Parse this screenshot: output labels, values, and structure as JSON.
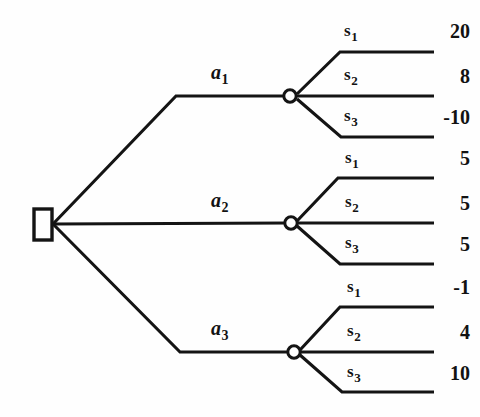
{
  "diagram": {
    "type": "decision-tree",
    "background_color": "#fefefe",
    "line_color": "#141414",
    "root": {
      "node_type": "decision",
      "shape": "square",
      "label": ""
    },
    "branches": [
      {
        "action_label": "a",
        "action_subscript": "1",
        "node_type": "chance",
        "shape": "circle",
        "outcomes": [
          {
            "state_label": "s",
            "state_subscript": "1",
            "payoff": "20"
          },
          {
            "state_label": "s",
            "state_subscript": "2",
            "payoff": "8"
          },
          {
            "state_label": "s",
            "state_subscript": "3",
            "payoff": "-10"
          }
        ]
      },
      {
        "action_label": "a",
        "action_subscript": "2",
        "node_type": "chance",
        "shape": "circle",
        "outcomes": [
          {
            "state_label": "s",
            "state_subscript": "1",
            "payoff": "5"
          },
          {
            "state_label": "s",
            "state_subscript": "2",
            "payoff": "5"
          },
          {
            "state_label": "s",
            "state_subscript": "3",
            "payoff": "5"
          }
        ]
      },
      {
        "action_label": "a",
        "action_subscript": "3",
        "node_type": "chance",
        "shape": "circle",
        "outcomes": [
          {
            "state_label": "s",
            "state_subscript": "1",
            "payoff": "-1"
          },
          {
            "state_label": "s",
            "state_subscript": "2",
            "payoff": "4"
          },
          {
            "state_label": "s",
            "state_subscript": "3",
            "payoff": "10"
          }
        ]
      }
    ]
  }
}
